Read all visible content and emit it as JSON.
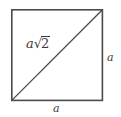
{
  "figure": {
    "stroke_color": "#4a4a4a",
    "text_color": "#3a3a3a",
    "background_color": "#ffffff",
    "square": {
      "left": 11,
      "top": 9,
      "right": 103,
      "bottom": 101,
      "side_px": 92,
      "stroke_width": 1.6
    },
    "diagonal": {
      "x1": 11,
      "y1": 101,
      "x2": 103,
      "y2": 9,
      "stroke_width": 1.3
    },
    "labels": {
      "diagonal": {
        "coefficient": "a",
        "radical_sign": "√",
        "radicand": "2",
        "full": "a√2"
      },
      "right_side": "a",
      "bottom_side": "a"
    }
  }
}
